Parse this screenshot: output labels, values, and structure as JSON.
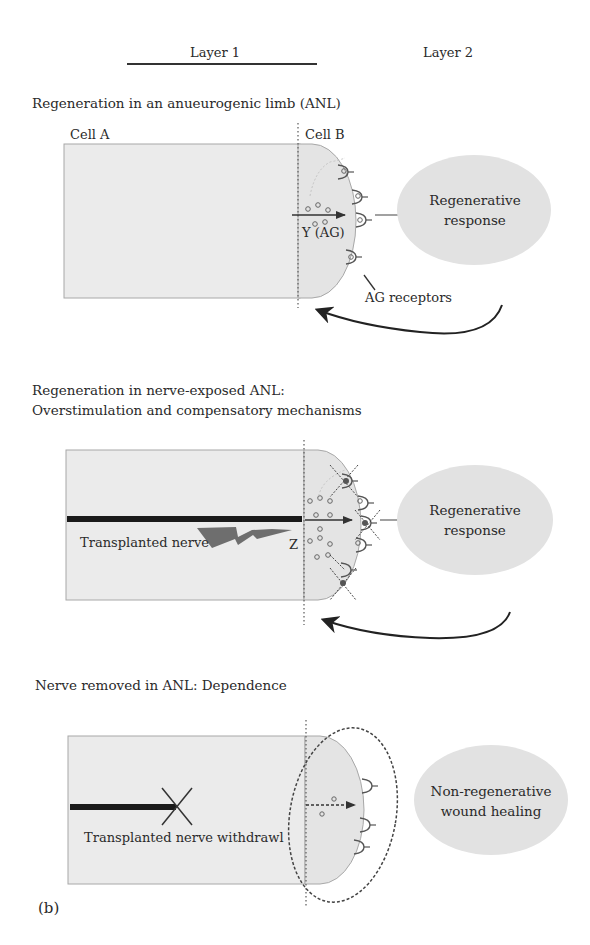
{
  "header": {
    "layer1": "Layer 1",
    "layer2": "Layer 2"
  },
  "panels": [
    {
      "title": "Regeneration in an anueurogenic limb (ANL)",
      "cell_a": "Cell A",
      "cell_b": "Cell B",
      "signal_label": "Y (AG)",
      "receptor_label": "AG receptors",
      "outcome": [
        "Regenerative",
        "response"
      ]
    },
    {
      "title_line1": "Regeneration in nerve-exposed ANL:",
      "title_line2": "Overstimulation and compensatory mechanisms",
      "nerve_label": "Transplanted nerve",
      "signal_label": "Z",
      "outcome": [
        "Regenerative",
        "response"
      ]
    },
    {
      "title": "Nerve removed in ANL: Dependence",
      "nerve_label": "Transplanted nerve withdrawl",
      "outcome": [
        "Non-regenerative",
        "wound healing"
      ]
    }
  ],
  "figure_label": "(b)",
  "colors": {
    "cell_fill": "#ebebeb",
    "cell_stroke": "#a8a8a8",
    "oval_fill": "#e2e2e2",
    "nerve": "#1a1a1a",
    "lightning": "#6e6e6e",
    "arrow": "#333333"
  }
}
